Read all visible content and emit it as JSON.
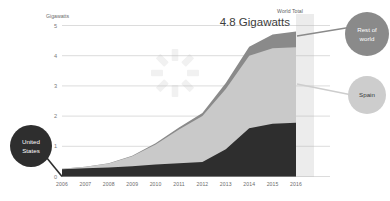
{
  "chart_data": {
    "type": "area",
    "title": "4.8 Gigawatts",
    "subtitle": "World Total",
    "xlabel": "",
    "ylabel": "Gigawatts",
    "ylim": [
      0,
      5
    ],
    "yticks": [
      "0",
      "1",
      "2",
      "3",
      "4",
      "5"
    ],
    "grid": true,
    "legend_position": "callout-circles",
    "stacked": true,
    "categories": [
      "2006",
      "2007",
      "2008",
      "2009",
      "2010",
      "2011",
      "2012",
      "2013",
      "2014",
      "2015",
      "2016"
    ],
    "series": [
      {
        "name": "United States",
        "color": "#2e2e2e",
        "values": [
          0.24,
          0.27,
          0.3,
          0.34,
          0.4,
          0.44,
          0.48,
          0.9,
          1.6,
          1.75,
          1.78
        ]
      },
      {
        "name": "Spain",
        "color": "#c9c9c9",
        "values": [
          0.02,
          0.05,
          0.13,
          0.33,
          0.66,
          1.12,
          1.52,
          2.0,
          2.4,
          2.5,
          2.5
        ]
      },
      {
        "name": "Rest of world",
        "color": "#8a8a8a",
        "values": [
          0.0,
          0.0,
          0.01,
          0.02,
          0.04,
          0.06,
          0.1,
          0.2,
          0.3,
          0.45,
          0.52
        ]
      }
    ],
    "annotations": [
      {
        "label": "World Total",
        "value": "4.8 Gigawatts",
        "at_year": "2016"
      }
    ],
    "highlight_band": {
      "year": "2016",
      "color": "#ececec"
    }
  },
  "axis": {
    "y_label": "Gigawatts",
    "y_ticks": [
      "5",
      "4",
      "3",
      "2",
      "1",
      "0"
    ],
    "x_ticks": [
      "2006",
      "2007",
      "2008",
      "2009",
      "2010",
      "2011",
      "2012",
      "2013",
      "2014",
      "2015",
      "2016"
    ]
  },
  "total": {
    "caption": "World Total",
    "value": "4.8 Gigawatts"
  },
  "callouts": [
    {
      "id": "united-states",
      "label_line1": "United",
      "label_line2": "States",
      "color": "#2e2e2e",
      "text_tone": "on-dark"
    },
    {
      "id": "rest-of-world",
      "label_line1": "Rest of",
      "label_line2": "world",
      "color": "#8a8a8a",
      "text_tone": "on-dark"
    },
    {
      "id": "spain",
      "label_line1": "Spain",
      "label_line2": "",
      "color": "#cdcdcd",
      "text_tone": "on-light"
    }
  ],
  "colors": {
    "united_states": "#2e2e2e",
    "spain": "#c9c9c9",
    "rest_of_world": "#8a8a8a",
    "gridline": "#b9b9b9",
    "highlight": "#ececec",
    "watermark": "#f2f2f2"
  }
}
